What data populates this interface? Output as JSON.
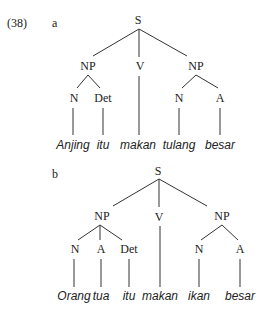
{
  "example": {
    "number": "(38)",
    "number_pos": [
      7,
      27
    ]
  },
  "trees": [
    {
      "id": "a",
      "label": "a",
      "label_pos": [
        52,
        27
      ],
      "nodes": [
        {
          "id": "S",
          "label": "S",
          "x": 138,
          "y": 24,
          "kind": "cat"
        },
        {
          "id": "NP1",
          "label": "NP",
          "x": 88,
          "y": 70,
          "kind": "cat"
        },
        {
          "id": "V",
          "label": "V",
          "x": 140,
          "y": 70,
          "kind": "cat"
        },
        {
          "id": "NP2",
          "label": "NP",
          "x": 196,
          "y": 70,
          "kind": "cat"
        },
        {
          "id": "N1",
          "label": "N",
          "x": 74,
          "y": 102,
          "kind": "cat"
        },
        {
          "id": "Det",
          "label": "Det",
          "x": 103,
          "y": 102,
          "kind": "cat"
        },
        {
          "id": "N2",
          "label": "N",
          "x": 179,
          "y": 102,
          "kind": "cat"
        },
        {
          "id": "A",
          "label": "A",
          "x": 220,
          "y": 102,
          "kind": "cat"
        },
        {
          "id": "w1",
          "label": "Anjing",
          "x": 73,
          "y": 149,
          "kind": "word"
        },
        {
          "id": "w2",
          "label": "itu",
          "x": 103,
          "y": 149,
          "kind": "word"
        },
        {
          "id": "w3",
          "label": "makan",
          "x": 138,
          "y": 149,
          "kind": "word"
        },
        {
          "id": "w4",
          "label": "tulang",
          "x": 179,
          "y": 149,
          "kind": "word"
        },
        {
          "id": "w5",
          "label": "besar",
          "x": 220,
          "y": 149,
          "kind": "word"
        }
      ],
      "edges": [
        [
          139,
          29,
          93,
          56
        ],
        [
          139,
          29,
          139,
          57
        ],
        [
          139,
          29,
          187,
          56
        ],
        [
          88,
          75,
          77,
          88
        ],
        [
          88,
          75,
          100,
          88
        ],
        [
          196,
          75,
          182,
          88
        ],
        [
          196,
          75,
          218,
          88
        ],
        [
          73,
          108,
          73,
          135
        ],
        [
          103,
          108,
          103,
          135
        ],
        [
          139,
          76,
          139,
          135
        ],
        [
          179,
          108,
          179,
          135
        ],
        [
          220,
          108,
          220,
          135
        ]
      ]
    },
    {
      "id": "b",
      "label": "b",
      "label_pos": [
        52,
        178
      ],
      "nodes": [
        {
          "id": "S",
          "label": "S",
          "x": 158,
          "y": 175,
          "kind": "cat"
        },
        {
          "id": "NP1",
          "label": "NP",
          "x": 102,
          "y": 220,
          "kind": "cat"
        },
        {
          "id": "V",
          "label": "V",
          "x": 159,
          "y": 221,
          "kind": "cat"
        },
        {
          "id": "NP2",
          "label": "NP",
          "x": 222,
          "y": 220,
          "kind": "cat"
        },
        {
          "id": "N1",
          "label": "N",
          "x": 75,
          "y": 253,
          "kind": "cat"
        },
        {
          "id": "A1",
          "label": "A",
          "x": 101,
          "y": 253,
          "kind": "cat"
        },
        {
          "id": "Det",
          "label": "Det",
          "x": 129,
          "y": 253,
          "kind": "cat"
        },
        {
          "id": "N2",
          "label": "N",
          "x": 199,
          "y": 253,
          "kind": "cat"
        },
        {
          "id": "A2",
          "label": "A",
          "x": 240,
          "y": 253,
          "kind": "cat"
        },
        {
          "id": "w1",
          "label": "Orang",
          "x": 74,
          "y": 300,
          "kind": "word"
        },
        {
          "id": "w2",
          "label": "tua",
          "x": 101,
          "y": 300,
          "kind": "word"
        },
        {
          "id": "w3",
          "label": "itu",
          "x": 129,
          "y": 300,
          "kind": "word"
        },
        {
          "id": "w4",
          "label": "makan",
          "x": 160,
          "y": 300,
          "kind": "word"
        },
        {
          "id": "w5",
          "label": "ikan",
          "x": 199,
          "y": 300,
          "kind": "word"
        },
        {
          "id": "w6",
          "label": "besar",
          "x": 240,
          "y": 300,
          "kind": "word"
        }
      ],
      "edges": [
        [
          159,
          179,
          113,
          206
        ],
        [
          159,
          179,
          159,
          207
        ],
        [
          159,
          179,
          207,
          206
        ],
        [
          100,
          225,
          78,
          240
        ],
        [
          100,
          225,
          100,
          240
        ],
        [
          100,
          225,
          122,
          240
        ],
        [
          222,
          225,
          201,
          240
        ],
        [
          222,
          225,
          238,
          240
        ],
        [
          74,
          259,
          74,
          287
        ],
        [
          101,
          259,
          101,
          287
        ],
        [
          129,
          259,
          129,
          287
        ],
        [
          160,
          226,
          160,
          287
        ],
        [
          199,
          259,
          199,
          287
        ],
        [
          240,
          259,
          240,
          287
        ]
      ]
    }
  ]
}
